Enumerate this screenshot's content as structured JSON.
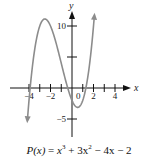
{
  "chart_data": {
    "type": "line",
    "title": "",
    "function": "P(x) = x^3 + 3x^2 - 4x - 2",
    "caption": {
      "lhs": "P(x)",
      "parts": [
        "x",
        "3",
        " + 3x",
        "2",
        " − 4x − 2"
      ]
    },
    "xlabel": "x",
    "ylabel": "y",
    "x_ticks": [
      -4,
      -3,
      -2,
      -1,
      1,
      2,
      3,
      4
    ],
    "x_tick_labels": [
      "−4",
      "−2",
      "0",
      "2",
      "4"
    ],
    "x_tick_label_values": [
      -4,
      -2,
      0,
      2,
      4
    ],
    "y_ticks": [
      10,
      5,
      -5
    ],
    "y_tick_labels": [
      "10",
      "−5"
    ],
    "y_tick_label_values": [
      10,
      -5
    ],
    "xlim": [
      -5.7,
      5.3
    ],
    "ylim": [
      -7.9,
      12.6
    ],
    "grid": false,
    "legend": null,
    "series": [
      {
        "name": "P(x)",
        "color": "#8c8c8c",
        "x": [
          -4.15,
          -4.0,
          -3.5,
          -3.0,
          -2.53,
          -2.0,
          -1.5,
          -1.0,
          -0.5,
          0.0,
          0.53,
          1.0,
          1.5,
          2.0,
          2.08
        ],
        "y": [
          -4.75,
          -2.0,
          6.13,
          10.0,
          11.13,
          10.0,
          7.63,
          4.0,
          -0.37,
          -2.0,
          -3.13,
          -2.0,
          1.13,
          10.0,
          11.2
        ]
      }
    ],
    "annotations": [
      "arrow at both ends of curve",
      "y-axis arrow",
      "x-axis arrow"
    ],
    "axis_color": "#111111"
  }
}
